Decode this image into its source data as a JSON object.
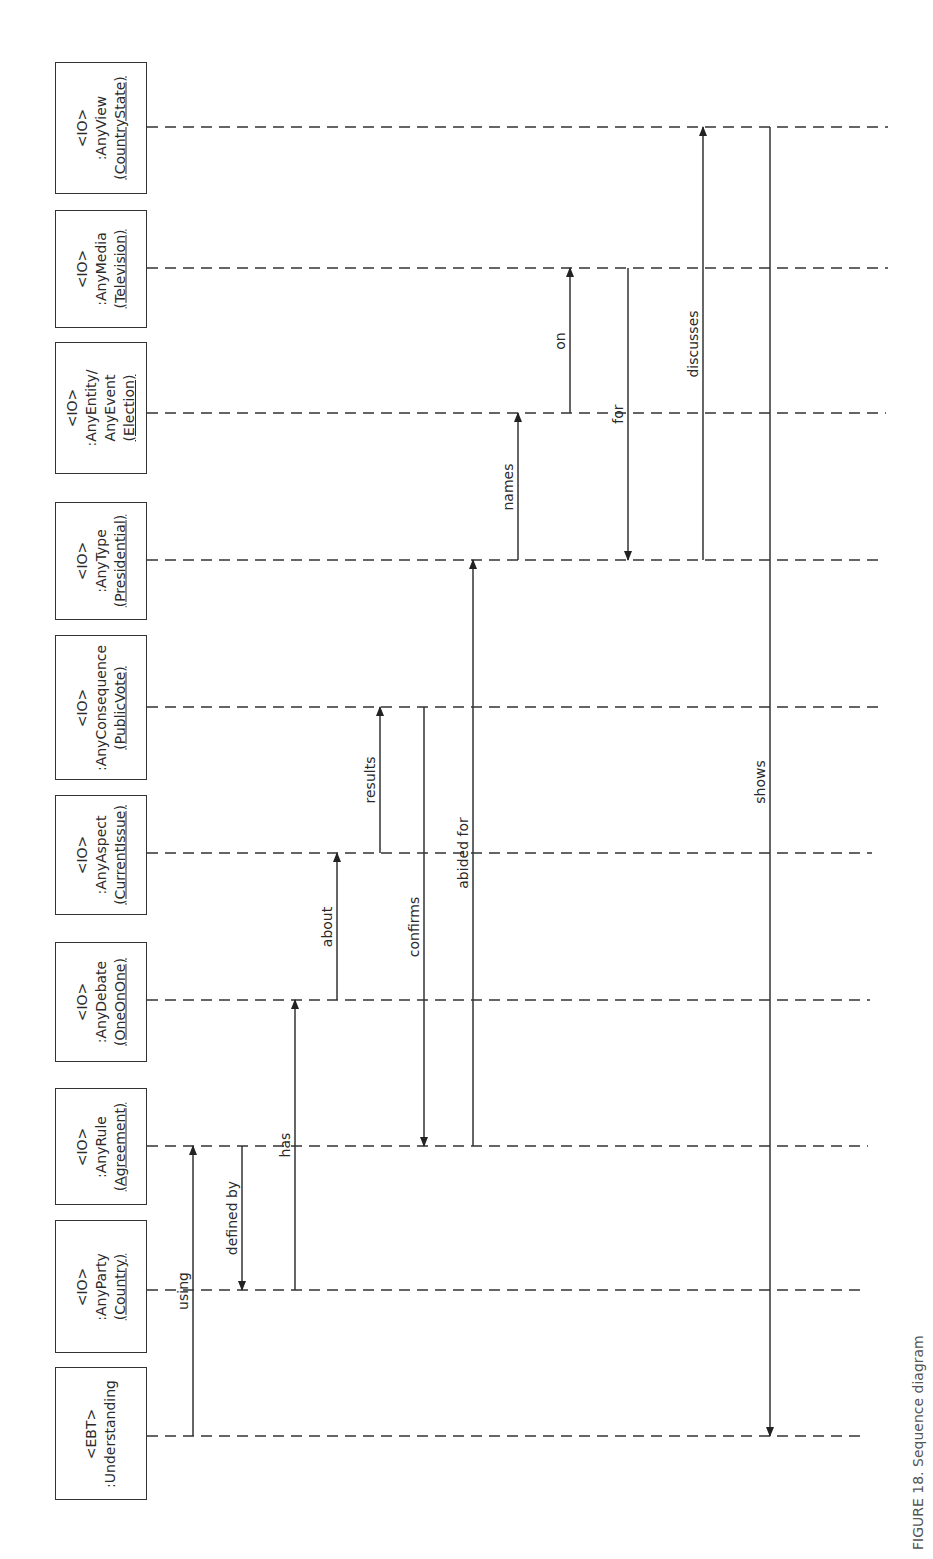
{
  "diagram": {
    "type": "sequence-diagram",
    "orientation": "rotated-90-ccw",
    "colors": {
      "line": "#333333",
      "text": "#2a2a2a",
      "background": "#ffffff"
    },
    "lifelines": [
      {
        "id": "view",
        "stereotype": "<IO>",
        "name": ":AnyView",
        "instance": "(CountryState)",
        "y": 127,
        "box_top": 62,
        "box_bottom": 194,
        "line_end": 888
      },
      {
        "id": "media",
        "stereotype": "<IO>",
        "name": ":AnyMedia",
        "instance": "(Television)",
        "y": 268,
        "box_top": 210,
        "box_bottom": 328,
        "line_end": 888
      },
      {
        "id": "entity",
        "stereotype": "<IO>",
        "name": ":AnyEntity/",
        "name2": "AnyEvent",
        "instance": "(Election)",
        "y": 413,
        "box_top": 342,
        "box_bottom": 474,
        "line_end": 886
      },
      {
        "id": "type",
        "stereotype": "<IO>",
        "name": ":AnyType",
        "instance": "(Presidential)",
        "y": 560,
        "box_top": 502,
        "box_bottom": 620,
        "line_end": 884
      },
      {
        "id": "consequence",
        "stereotype": "<IO>",
        "name": ":AnyConsequence",
        "instance": "(PublicVote)",
        "y": 707,
        "box_top": 635,
        "box_bottom": 780,
        "line_end": 878
      },
      {
        "id": "aspect",
        "stereotype": "<IO>",
        "name": ":AnyAspect",
        "instance": "(CurrentIssue)",
        "y": 853,
        "box_top": 795,
        "box_bottom": 915,
        "line_end": 872
      },
      {
        "id": "debate",
        "stereotype": "<IO>",
        "name": ":AnyDebate",
        "instance": "(OneOnOne)",
        "y": 1000,
        "box_top": 942,
        "box_bottom": 1062,
        "line_end": 870
      },
      {
        "id": "rule",
        "stereotype": "<IO>",
        "name": ":AnyRule",
        "instance": "(Agreement)",
        "y": 1146,
        "box_top": 1088,
        "box_bottom": 1205,
        "line_end": 868
      },
      {
        "id": "party",
        "stereotype": "<IO>",
        "name": ":AnyParty",
        "instance": "(Country)",
        "y": 1290,
        "box_top": 1220,
        "box_bottom": 1353,
        "line_end": 866
      },
      {
        "id": "understanding",
        "stereotype": "<EBT>",
        "name": ":Understanding",
        "instance": "",
        "y": 1436,
        "box_top": 1367,
        "box_bottom": 1500,
        "line_end": 866
      }
    ],
    "messages": [
      {
        "label": "using",
        "from": "understanding",
        "to": "rule",
        "x": 193
      },
      {
        "label": "defined by",
        "from": "rule",
        "to": "party",
        "x": 242
      },
      {
        "label": "has",
        "from": "party",
        "to": "debate",
        "x": 295
      },
      {
        "label": "about",
        "from": "debate",
        "to": "aspect",
        "x": 337
      },
      {
        "label": "results",
        "from": "aspect",
        "to": "consequence",
        "x": 380
      },
      {
        "label": "confirms",
        "from": "consequence",
        "to": "rule",
        "x": 424
      },
      {
        "label": "abided for",
        "from": "rule",
        "to": "type",
        "x": 473
      },
      {
        "label": "names",
        "from": "type",
        "to": "entity",
        "x": 518
      },
      {
        "label": "on",
        "from": "entity",
        "to": "media",
        "x": 570
      },
      {
        "label": "for",
        "from": "media",
        "to": "type",
        "x": 628
      },
      {
        "label": "discusses",
        "from": "type",
        "to": "view",
        "x": 703
      },
      {
        "label": "shows",
        "from": "view",
        "to": "understanding",
        "x": 770
      }
    ],
    "caption_fragment": "FIGURE 18. Sequence diagram"
  }
}
